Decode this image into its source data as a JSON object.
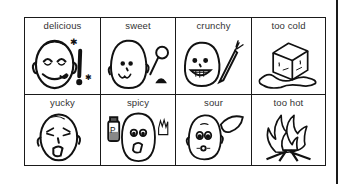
{
  "board": {
    "cells": [
      {
        "label": "delicious",
        "icon": "delicious-face-icon"
      },
      {
        "label": "sweet",
        "icon": "sweet-face-lollipop-icon"
      },
      {
        "label": "crunchy",
        "icon": "crunchy-face-carrot-icon"
      },
      {
        "label": "too cold",
        "icon": "melting-ice-cube-icon"
      },
      {
        "label": "yucky",
        "icon": "yucky-face-icon"
      },
      {
        "label": "spicy",
        "icon": "spicy-face-pepper-icon"
      },
      {
        "label": "sour",
        "icon": "sour-face-lemon-icon"
      },
      {
        "label": "too hot",
        "icon": "fire-icon"
      }
    ],
    "line_color": "#1a1a1a"
  }
}
